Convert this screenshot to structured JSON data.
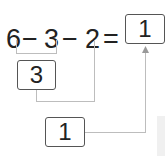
{
  "equation": {
    "tokens": [
      "6",
      "−",
      "3",
      "−",
      "2",
      "="
    ],
    "result": "1"
  },
  "steps": {
    "first_result": "3",
    "second_result": "1"
  },
  "colors": {
    "text": "#222222",
    "box_border": "#555555",
    "connector": "#bdbdbd"
  }
}
